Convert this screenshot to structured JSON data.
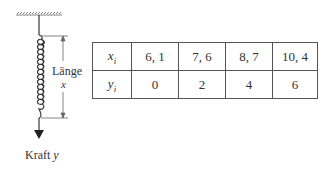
{
  "diagram": {
    "length_label": "Länge",
    "length_var": "x",
    "force_label": "Kraft",
    "force_var": "y"
  },
  "table": {
    "rows": [
      {
        "header_var": "x",
        "header_sub": "i",
        "values": [
          "6, 1",
          "7, 6",
          "8, 7",
          "10, 4"
        ]
      },
      {
        "header_var": "y",
        "header_sub": "i",
        "values": [
          "0",
          "2",
          "4",
          "6"
        ]
      }
    ]
  },
  "colors": {
    "line": "#333333",
    "background": "#ffffff"
  }
}
